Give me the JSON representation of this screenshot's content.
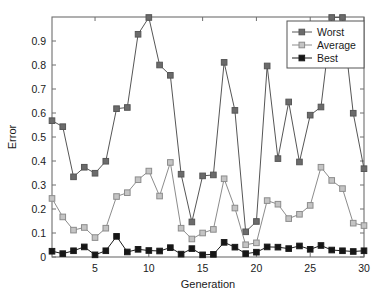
{
  "chart_data": {
    "type": "line",
    "title": "",
    "xlabel": "Generation",
    "ylabel": "Error",
    "xlim": [
      1,
      30
    ],
    "ylim": [
      0,
      1.0
    ],
    "xticks": [
      5,
      10,
      15,
      20,
      25,
      30
    ],
    "yticks": [
      0,
      0.1,
      0.2,
      0.3,
      0.4,
      0.5,
      0.6,
      0.7,
      0.8,
      0.9
    ],
    "ytick_labels": [
      "0",
      "0.1",
      "0.2",
      "0.3",
      "0.4",
      "0.5",
      "0.6",
      "0.7",
      "0.8",
      "0.9"
    ],
    "xtick_labels": [
      "5",
      "10",
      "15",
      "20",
      "25",
      "30"
    ],
    "grid": false,
    "legend_position": "top-right",
    "x": [
      1,
      2,
      3,
      4,
      5,
      6,
      7,
      8,
      9,
      10,
      11,
      12,
      13,
      14,
      15,
      16,
      17,
      18,
      19,
      20,
      21,
      22,
      23,
      24,
      25,
      26,
      27,
      28,
      29,
      30
    ],
    "series": [
      {
        "name": "Worst",
        "color": "#565656",
        "marker": "square",
        "marker_fill": "#6b6b6b",
        "values": [
          0.568,
          0.543,
          0.334,
          0.374,
          0.349,
          0.399,
          0.618,
          0.623,
          0.928,
          0.998,
          0.8,
          0.757,
          0.345,
          0.146,
          0.338,
          0.342,
          0.811,
          0.611,
          0.105,
          0.148,
          0.796,
          0.41,
          0.646,
          0.396,
          0.591,
          0.625,
          0.998,
          0.998,
          0.599,
          0.368
        ]
      },
      {
        "name": "Average",
        "color": "#8c8c8c",
        "marker": "square",
        "marker_fill": "#c4c4c4",
        "values": [
          0.244,
          0.167,
          0.112,
          0.123,
          0.081,
          0.12,
          0.252,
          0.268,
          0.322,
          0.358,
          0.254,
          0.394,
          0.12,
          0.075,
          0.1,
          0.115,
          0.326,
          0.204,
          0.051,
          0.059,
          0.235,
          0.22,
          0.16,
          0.178,
          0.215,
          0.374,
          0.319,
          0.285,
          0.141,
          0.131
        ]
      },
      {
        "name": "Best",
        "color": "#1c1c1c",
        "marker": "square",
        "marker_fill": "#161616",
        "values": [
          0.024,
          0.014,
          0.026,
          0.042,
          0.009,
          0.026,
          0.086,
          0.021,
          0.032,
          0.027,
          0.025,
          0.039,
          0.012,
          0.035,
          0.009,
          0.011,
          0.061,
          0.041,
          0.014,
          0.02,
          0.042,
          0.041,
          0.035,
          0.046,
          0.032,
          0.048,
          0.029,
          0.026,
          0.023,
          0.026
        ]
      }
    ]
  },
  "legend": {
    "items": [
      {
        "label": "Worst"
      },
      {
        "label": "Average"
      },
      {
        "label": "Best"
      }
    ]
  },
  "axes": {
    "x_title": "Generation",
    "y_title": "Error"
  }
}
